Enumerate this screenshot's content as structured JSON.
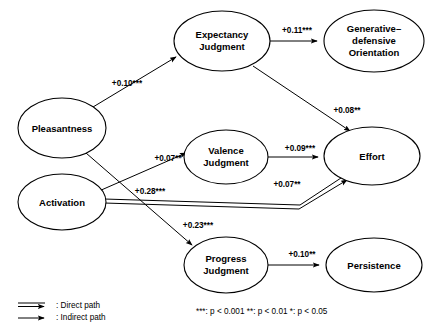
{
  "diagram": {
    "type": "path-diagram",
    "nodes": [
      {
        "id": "pleasantness",
        "label_lines": [
          "Pleasantness"
        ],
        "cx": 62,
        "cy": 128,
        "rx": 44,
        "ry": 30
      },
      {
        "id": "activation",
        "label_lines": [
          "Activation"
        ],
        "cx": 62,
        "cy": 202,
        "rx": 44,
        "ry": 28
      },
      {
        "id": "expectancy_judgment",
        "label_lines": [
          "Expectancy",
          "Judgment"
        ],
        "cx": 222,
        "cy": 41,
        "rx": 48,
        "ry": 30
      },
      {
        "id": "generative_defensive_orientation",
        "label_lines": [
          "Generative–",
          "defensive",
          "Orientation"
        ],
        "cx": 374,
        "cy": 41,
        "rx": 50,
        "ry": 31
      },
      {
        "id": "valence_judgment",
        "label_lines": [
          "Valence",
          "Judgment"
        ],
        "cx": 226,
        "cy": 157,
        "rx": 42,
        "ry": 27
      },
      {
        "id": "effort",
        "label_lines": [
          "Effort"
        ],
        "cx": 372,
        "cy": 156,
        "rx": 48,
        "ry": 29
      },
      {
        "id": "progress_judgment",
        "label_lines": [
          "Progress",
          "Judgment"
        ],
        "cx": 226,
        "cy": 265,
        "rx": 42,
        "ry": 28
      },
      {
        "id": "persistence",
        "label_lines": [
          "Persistence"
        ],
        "cx": 374,
        "cy": 265,
        "rx": 48,
        "ry": 27
      }
    ],
    "edges": [
      {
        "id": "pleasantness-to-expectancy",
        "from": "pleasantness",
        "to": "expectancy_judgment",
        "coefficient": "+0.10***",
        "path_type": "indirect",
        "label_x": 127,
        "label_y": 86
      },
      {
        "id": "expectancy-to-orientation",
        "from": "expectancy_judgment",
        "to": "generative_defensive_orientation",
        "coefficient": "+0.11***",
        "path_type": "indirect",
        "label_x": 297,
        "label_y": 33
      },
      {
        "id": "expectancy-to-effort",
        "from": "expectancy_judgment",
        "to": "effort",
        "coefficient": "+0.08**",
        "path_type": "indirect",
        "label_x": 343,
        "label_y": 111
      },
      {
        "id": "activation-to-valence",
        "from": "activation",
        "to": "valence_judgment",
        "coefficient": "+0.07**",
        "path_type": "indirect",
        "label_x": 169,
        "label_y": 160
      },
      {
        "id": "valence-to-effort",
        "from": "valence_judgment",
        "to": "effort",
        "coefficient": "+0.09***",
        "path_type": "indirect",
        "label_x": 300,
        "label_y": 152
      },
      {
        "id": "activation-to-effort-direct",
        "from": "activation",
        "to": "effort",
        "coefficient": "+0.28***",
        "path_type": "direct",
        "label_x": 150,
        "label_y": 194
      },
      {
        "id": "activation-to-effort-secondary",
        "from": "activation",
        "to": "effort",
        "coefficient": "+0.07**",
        "path_type": "indirect",
        "label_x": 287,
        "label_y": 187
      },
      {
        "id": "pleasantness-to-progress",
        "from": "pleasantness",
        "to": "progress_judgment",
        "coefficient": "+0.23***",
        "path_type": "indirect",
        "label_x": 196,
        "label_y": 227
      },
      {
        "id": "progress-to-persistence",
        "from": "progress_judgment",
        "to": "persistence",
        "coefficient": "+0.10**",
        "path_type": "indirect",
        "label_x": 302,
        "label_y": 253
      }
    ],
    "legend": {
      "direct_label": ": Direct path",
      "indirect_label": ": Indirect path",
      "significance_note": "***: p < 0.001  **: p < 0.01  *: p < 0.05"
    }
  }
}
